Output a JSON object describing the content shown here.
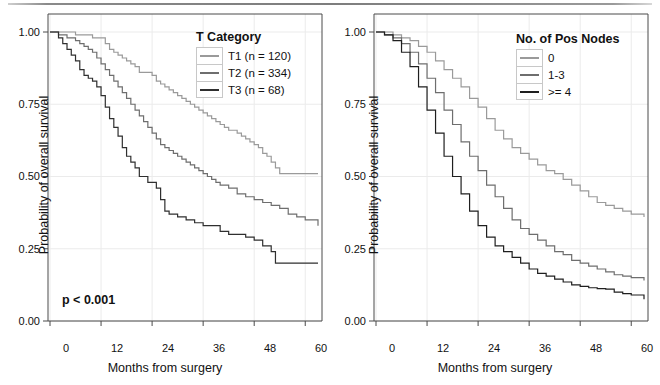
{
  "figure": {
    "top_rule": "horizontal-rule",
    "background": "#ffffff"
  },
  "chart_data": [
    {
      "type": "line",
      "subtype": "kaplan-meier-step",
      "panel": "left",
      "title": "",
      "xlabel": "Months from surgery",
      "ylabel": "Probability of overall survival",
      "xlim": [
        0,
        63
      ],
      "ylim": [
        0.0,
        1.0
      ],
      "xticks": [
        0,
        12,
        24,
        36,
        48,
        60
      ],
      "xticklabels": [
        "0",
        "12",
        "24",
        "36",
        "48",
        "60"
      ],
      "yticks": [
        0.0,
        0.25,
        0.5,
        0.75,
        1.0
      ],
      "yticklabels": [
        "0.00",
        "0.25",
        "0.50",
        "0.75",
        "1.00"
      ],
      "grid": true,
      "legend_title": "T Category",
      "legend_position": "upper-right-inside",
      "annotations": [
        {
          "text": "p < 0.001",
          "x": 8,
          "y": 0.1
        }
      ],
      "series": [
        {
          "name": "T1 (n = 120)",
          "label": "T1",
          "n": 120,
          "color": "#9a9a9a",
          "x": [
            0,
            3,
            6,
            8,
            10,
            12,
            13,
            14,
            15,
            16,
            17,
            18,
            19,
            20,
            21,
            22,
            23,
            24,
            25,
            26,
            27,
            28,
            29,
            30,
            31,
            32,
            33,
            34,
            35,
            36,
            37,
            38,
            39,
            40,
            41,
            42,
            44,
            45,
            46,
            47,
            48,
            49,
            50,
            51,
            52,
            53,
            54,
            63
          ],
          "y": [
            1.0,
            1.0,
            0.99,
            0.99,
            0.98,
            0.98,
            0.96,
            0.94,
            0.93,
            0.92,
            0.91,
            0.9,
            0.89,
            0.88,
            0.86,
            0.86,
            0.86,
            0.85,
            0.83,
            0.82,
            0.81,
            0.8,
            0.79,
            0.78,
            0.77,
            0.76,
            0.75,
            0.74,
            0.73,
            0.72,
            0.71,
            0.7,
            0.69,
            0.68,
            0.67,
            0.66,
            0.65,
            0.64,
            0.63,
            0.62,
            0.61,
            0.6,
            0.58,
            0.57,
            0.55,
            0.53,
            0.51,
            0.51
          ]
        },
        {
          "name": "T2 (n = 334)",
          "label": "T2",
          "n": 334,
          "color": "#6e6e6e",
          "x": [
            0,
            2,
            4,
            6,
            7,
            8,
            9,
            10,
            11,
            12,
            13,
            14,
            15,
            16,
            17,
            18,
            19,
            20,
            21,
            22,
            23,
            24,
            25,
            26,
            27,
            28,
            29,
            30,
            31,
            32,
            33,
            34,
            35,
            36,
            37,
            38,
            39,
            40,
            42,
            44,
            46,
            48,
            50,
            52,
            54,
            56,
            58,
            60,
            63
          ],
          "y": [
            1.0,
            0.99,
            0.98,
            0.97,
            0.96,
            0.95,
            0.94,
            0.93,
            0.91,
            0.89,
            0.87,
            0.85,
            0.83,
            0.81,
            0.79,
            0.77,
            0.75,
            0.73,
            0.71,
            0.69,
            0.67,
            0.65,
            0.63,
            0.61,
            0.6,
            0.59,
            0.58,
            0.57,
            0.56,
            0.55,
            0.54,
            0.53,
            0.52,
            0.51,
            0.5,
            0.49,
            0.48,
            0.47,
            0.46,
            0.44,
            0.43,
            0.42,
            0.41,
            0.4,
            0.39,
            0.37,
            0.36,
            0.35,
            0.33
          ]
        },
        {
          "name": "T3 (n = 68)",
          "label": "T3",
          "n": 68,
          "color": "#2f2f2f",
          "x": [
            0,
            2,
            3,
            4,
            5,
            6,
            7,
            8,
            9,
            10,
            11,
            12,
            13,
            14,
            15,
            16,
            17,
            18,
            19,
            20,
            21,
            22,
            23,
            24,
            25,
            26,
            27,
            28,
            30,
            32,
            34,
            36,
            38,
            40,
            42,
            44,
            46,
            48,
            50,
            52,
            53,
            54,
            63
          ],
          "y": [
            1.0,
            0.98,
            0.96,
            0.94,
            0.92,
            0.9,
            0.87,
            0.85,
            0.84,
            0.83,
            0.81,
            0.78,
            0.74,
            0.7,
            0.67,
            0.64,
            0.6,
            0.57,
            0.55,
            0.53,
            0.5,
            0.5,
            0.48,
            0.48,
            0.46,
            0.42,
            0.38,
            0.37,
            0.36,
            0.35,
            0.34,
            0.33,
            0.33,
            0.31,
            0.3,
            0.3,
            0.29,
            0.28,
            0.26,
            0.24,
            0.2,
            0.2,
            0.2
          ]
        }
      ]
    },
    {
      "type": "line",
      "subtype": "kaplan-meier-step",
      "panel": "right",
      "title": "",
      "xlabel": "Months from surgery",
      "ylabel": "Probability of overall survival",
      "xlim": [
        0,
        63
      ],
      "ylim": [
        0.0,
        1.0
      ],
      "xticks": [
        0,
        12,
        24,
        36,
        48,
        60
      ],
      "xticklabels": [
        "0",
        "12",
        "24",
        "36",
        "48",
        "60"
      ],
      "yticks": [
        0.0,
        0.25,
        0.5,
        0.75,
        1.0
      ],
      "yticklabels": [
        "0.00",
        "0.25",
        "0.50",
        "0.75",
        "1.00"
      ],
      "grid": true,
      "legend_title": "No. of Pos Nodes",
      "legend_position": "upper-right-inside",
      "annotations": [],
      "series": [
        {
          "name": "0",
          "label": "0",
          "color": "#9a9a9a",
          "x": [
            0,
            2,
            4,
            6,
            8,
            10,
            12,
            14,
            16,
            18,
            20,
            22,
            24,
            26,
            28,
            30,
            32,
            34,
            36,
            38,
            40,
            42,
            44,
            46,
            48,
            50,
            52,
            54,
            56,
            58,
            60,
            63
          ],
          "y": [
            1.0,
            1.0,
            0.99,
            0.98,
            0.97,
            0.95,
            0.93,
            0.9,
            0.87,
            0.84,
            0.81,
            0.77,
            0.74,
            0.7,
            0.66,
            0.63,
            0.6,
            0.58,
            0.56,
            0.54,
            0.52,
            0.51,
            0.49,
            0.47,
            0.45,
            0.43,
            0.41,
            0.4,
            0.39,
            0.38,
            0.37,
            0.36
          ]
        },
        {
          "name": "1-3",
          "label": "1-3",
          "color": "#6e6e6e",
          "x": [
            0,
            2,
            4,
            6,
            8,
            10,
            12,
            14,
            16,
            18,
            20,
            22,
            24,
            26,
            28,
            30,
            32,
            34,
            36,
            38,
            40,
            42,
            44,
            46,
            48,
            50,
            52,
            54,
            56,
            58,
            60,
            63
          ],
          "y": [
            1.0,
            0.99,
            0.98,
            0.96,
            0.93,
            0.89,
            0.84,
            0.79,
            0.73,
            0.68,
            0.62,
            0.57,
            0.52,
            0.47,
            0.43,
            0.39,
            0.35,
            0.32,
            0.3,
            0.28,
            0.26,
            0.24,
            0.23,
            0.21,
            0.2,
            0.19,
            0.18,
            0.17,
            0.16,
            0.155,
            0.15,
            0.14
          ]
        },
        {
          "name": ">= 4",
          "label": ">= 4",
          "color": "#1f1f1f",
          "x": [
            0,
            2,
            4,
            6,
            8,
            10,
            12,
            14,
            16,
            18,
            20,
            22,
            24,
            26,
            28,
            30,
            32,
            34,
            36,
            38,
            40,
            42,
            44,
            46,
            48,
            50,
            52,
            54,
            56,
            58,
            60,
            63
          ],
          "y": [
            1.0,
            0.99,
            0.97,
            0.93,
            0.88,
            0.81,
            0.73,
            0.65,
            0.57,
            0.5,
            0.44,
            0.38,
            0.33,
            0.29,
            0.26,
            0.24,
            0.22,
            0.2,
            0.18,
            0.165,
            0.155,
            0.145,
            0.135,
            0.125,
            0.12,
            0.115,
            0.112,
            0.11,
            0.1,
            0.095,
            0.09,
            0.075
          ]
        }
      ]
    }
  ]
}
